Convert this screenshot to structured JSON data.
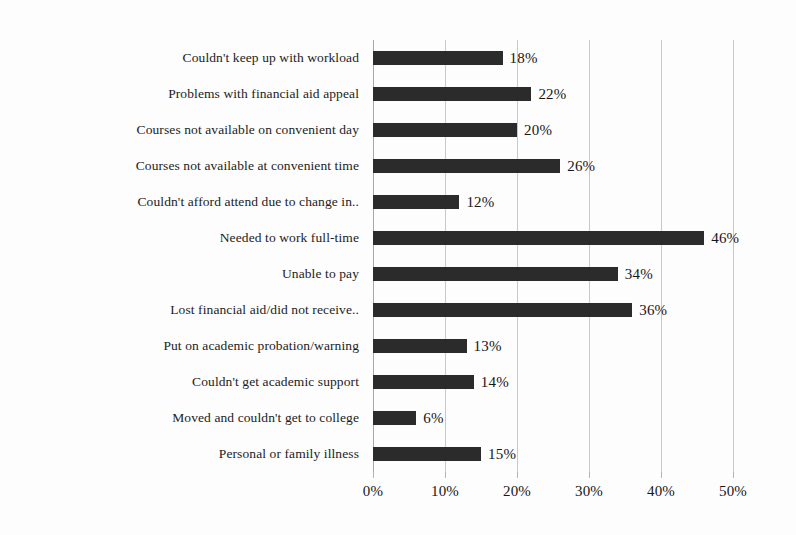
{
  "chart_data": {
    "type": "bar",
    "orientation": "horizontal",
    "title": "",
    "subtitle": "",
    "xlabel": "",
    "ylabel": "",
    "xlim": [
      0,
      50
    ],
    "grid": true,
    "legend": false,
    "legend_position": "none",
    "value_suffix": "%",
    "bar_color": "#2b2b2b",
    "gridline_color": "#c8c8c8",
    "axis_color": "#a8a8a8",
    "x_ticks": [
      0,
      10,
      20,
      30,
      40,
      50
    ],
    "x_tick_labels": [
      "0%",
      "10%",
      "20%",
      "30%",
      "40%",
      "50%"
    ],
    "categories": [
      "Couldn't keep up with workload",
      "Problems with financial aid appeal",
      "Courses not available on convenient day",
      "Courses not available at convenient time",
      "Couldn't afford attend due to change in..",
      "Needed to work full-time",
      "Unable to pay",
      "Lost financial aid/did not receive..",
      "Put on academic probation/warning",
      "Couldn't get academic support",
      "Moved and couldn't get to college",
      "Personal or family illness"
    ],
    "values": [
      18,
      22,
      20,
      26,
      12,
      46,
      34,
      36,
      13,
      14,
      6,
      15
    ],
    "data_labels": [
      "18%",
      "22%",
      "20%",
      "26%",
      "12%",
      "46%",
      "34%",
      "36%",
      "13%",
      "14%",
      "6%",
      "15%"
    ]
  }
}
